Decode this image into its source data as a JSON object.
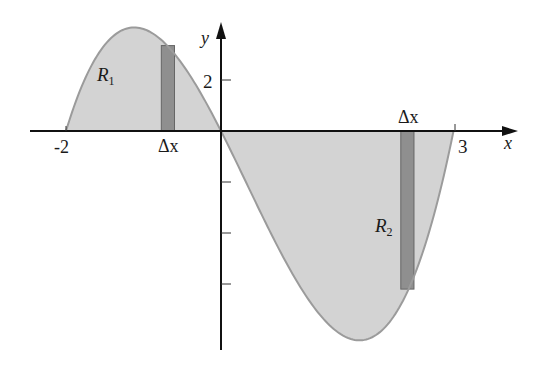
{
  "chart_data": {
    "type": "area",
    "function": "y = x(x+2)(x-3)",
    "x_domain": [
      -2,
      3
    ],
    "xlabel": "x",
    "ylabel": "y",
    "x_tick_labels": [
      {
        "value": -2,
        "label": "-2"
      },
      {
        "value": 3,
        "label": "3"
      }
    ],
    "y_ticks": [
      2,
      -2,
      -4,
      -6
    ],
    "y_tick_labels": [
      {
        "value": 2,
        "label": "2"
      }
    ],
    "regions": [
      {
        "name": "R1",
        "label": "R",
        "subscript": "1",
        "x_range": [
          -2,
          0
        ],
        "sign": "above"
      },
      {
        "name": "R2",
        "label": "R",
        "subscript": "2",
        "x_range": [
          0,
          3
        ],
        "sign": "below"
      }
    ],
    "rectangles": [
      {
        "label": "Δx",
        "x_left": -0.77,
        "x_right": -0.6,
        "height": 3.35
      },
      {
        "label": "Δx",
        "x_left": 2.32,
        "x_right": 2.49,
        "height": -6.2
      }
    ],
    "grid": false,
    "legend": "none"
  },
  "colors": {
    "region_fill": "#d3d3d3",
    "curve": "#9b9b9b",
    "rect_fill": "#8f8f8f",
    "rect_stroke": "#666666",
    "axis": "#111111"
  },
  "layout": {
    "origin_px": [
      221,
      131
    ],
    "x_unit_px": 77.5,
    "y_unit_px": 25.5
  }
}
